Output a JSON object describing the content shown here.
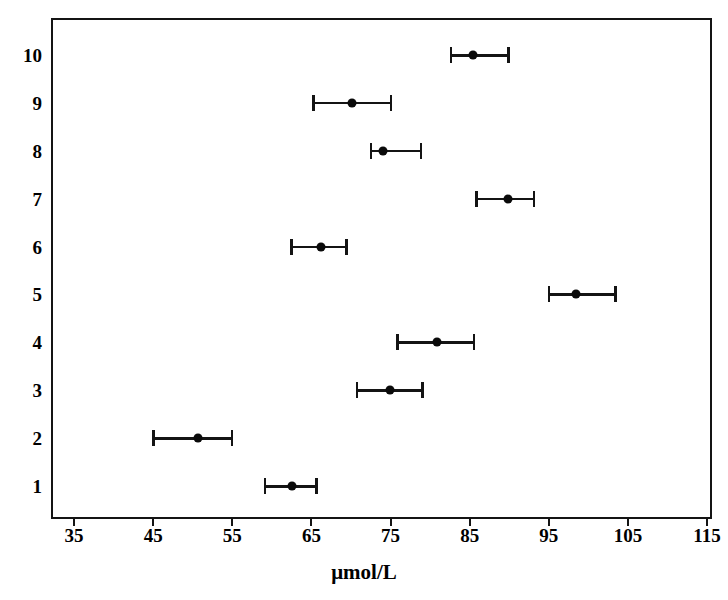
{
  "chart_data": {
    "type": "scatter",
    "title": "",
    "subtitle": "",
    "xlabel": "μmol/L",
    "ylabel": "",
    "xlim": [
      31,
      117.5
    ],
    "ylim": [
      0.5,
      10.5
    ],
    "grid": false,
    "legend": null,
    "orientation": "horizontal",
    "marker": "filled-circle",
    "errorbar_style": "capped-horizontal",
    "xticks": [
      35,
      45,
      55,
      65,
      75,
      85,
      95,
      105,
      115
    ],
    "xtick_labels": [
      "35",
      "45",
      "55",
      "65",
      "75",
      "85",
      "95",
      "105",
      "115"
    ],
    "yticks": [
      1,
      2,
      3,
      4,
      5,
      6,
      7,
      8,
      9,
      10
    ],
    "ytick_labels": [
      "1",
      "2",
      "3",
      "4",
      "5",
      "6",
      "7",
      "8",
      "9",
      "10"
    ],
    "categories": [
      "1",
      "2",
      "3",
      "4",
      "5",
      "6",
      "7",
      "8",
      "9",
      "10"
    ],
    "series": [
      {
        "name": "Mean with range",
        "points": [
          {
            "category": "1",
            "y": 1,
            "value": 62.6,
            "low": 59.0,
            "high": 65.8
          },
          {
            "category": "2",
            "y": 2,
            "value": 50.7,
            "low": 44.9,
            "high": 55.1
          },
          {
            "category": "3",
            "y": 3,
            "value": 74.9,
            "low": 70.6,
            "high": 79.2
          },
          {
            "category": "4",
            "y": 4,
            "value": 80.9,
            "low": 75.7,
            "high": 85.7
          },
          {
            "category": "5",
            "y": 5,
            "value": 98.4,
            "low": 94.9,
            "high": 103.6
          },
          {
            "category": "6",
            "y": 6,
            "value": 66.2,
            "low": 62.3,
            "high": 69.6
          },
          {
            "category": "7",
            "y": 7,
            "value": 89.9,
            "low": 85.7,
            "high": 93.3
          },
          {
            "category": "8",
            "y": 8,
            "value": 74.1,
            "low": 72.4,
            "high": 79.0
          },
          {
            "category": "9",
            "y": 9,
            "value": 70.1,
            "low": 65.1,
            "high": 75.2
          },
          {
            "category": "10",
            "y": 10,
            "value": 85.4,
            "low": 82.5,
            "high": 90.1
          }
        ]
      }
    ],
    "colors": {
      "axis": "#141414",
      "marker": "#0a0a0a",
      "errorbar": "#141414",
      "background": "#ffffff"
    }
  }
}
